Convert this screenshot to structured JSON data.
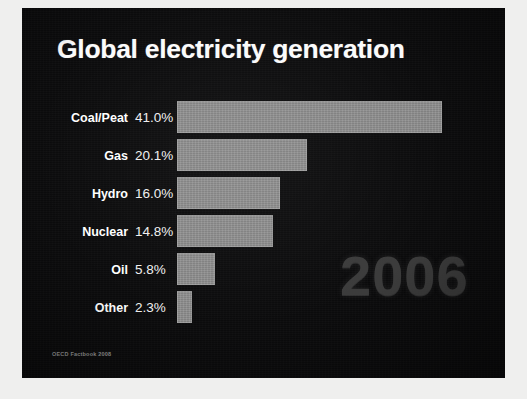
{
  "slide": {
    "title": "Global electricity generation",
    "watermark_year": "2006",
    "source_note": "OECD Factbook 2008",
    "background_color": "#0b0b0c",
    "title_color": "#fbfbfb",
    "bar_color": "#8d8d8d",
    "watermark_color": "#3c3c3c"
  },
  "chart_data": {
    "type": "bar",
    "orientation": "horizontal",
    "title": "Global electricity generation",
    "xlabel": "",
    "ylabel": "",
    "unit": "%",
    "grid": false,
    "legend": false,
    "xlim": [
      0,
      41.0
    ],
    "categories": [
      "Coal/Peat",
      "Gas",
      "Hydro",
      "Nuclear",
      "Oil",
      "Other"
    ],
    "values": [
      41.0,
      20.1,
      16.0,
      14.8,
      5.8,
      2.3
    ],
    "value_labels": [
      "41.0%",
      "20.1%",
      "16.0%",
      "14.8%",
      "5.8%",
      "2.3%"
    ],
    "annotations": [
      "2006",
      "OECD Factbook 2008"
    ],
    "rows": [
      {
        "category": "Coal/Peat",
        "value": 41.0,
        "label": "41.0%",
        "bar_px": 265
      },
      {
        "category": "Gas",
        "value": 20.1,
        "label": "20.1%",
        "bar_px": 130
      },
      {
        "category": "Hydro",
        "value": 16.0,
        "label": "16.0%",
        "bar_px": 103
      },
      {
        "category": "Nuclear",
        "value": 14.8,
        "label": "14.8%",
        "bar_px": 96
      },
      {
        "category": "Oil",
        "value": 5.8,
        "label": "5.8%",
        "bar_px": 38
      },
      {
        "category": "Other",
        "value": 2.3,
        "label": "2.3%",
        "bar_px": 15
      }
    ]
  }
}
